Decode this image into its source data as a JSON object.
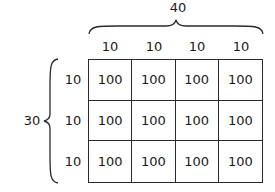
{
  "diagram": {
    "type": "area-model-grid",
    "total_width_label": "40",
    "total_height_label": "30",
    "column_labels": [
      "10",
      "10",
      "10",
      "10"
    ],
    "row_labels": [
      "10",
      "10",
      "10"
    ],
    "cells": [
      [
        "100",
        "100",
        "100",
        "100"
      ],
      [
        "100",
        "100",
        "100",
        "100"
      ],
      [
        "100",
        "100",
        "100",
        "100"
      ]
    ]
  }
}
